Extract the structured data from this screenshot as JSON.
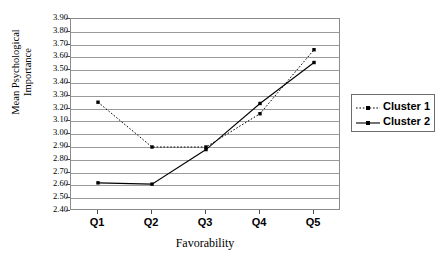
{
  "chart_data": {
    "type": "line",
    "title": "",
    "xlabel": "Favorability",
    "ylabel": "Mean Psychological\nImportance",
    "categories": [
      "Q1",
      "Q2",
      "Q3",
      "Q4",
      "Q5"
    ],
    "ylim": [
      2.4,
      3.9
    ],
    "ystep": 0.1,
    "ytick_labels": [
      "3.90",
      "3.80",
      "3.70",
      "3.60",
      "3.50",
      "3.40",
      "3.30",
      "3.20",
      "3.10",
      "3.00",
      "2.90",
      "2.80",
      "2.70",
      "2.60",
      "2.50",
      "2.40"
    ],
    "grid": true,
    "legend_position": "right",
    "series": [
      {
        "name": "Cluster 1",
        "values": [
          3.25,
          2.9,
          2.9,
          3.16,
          3.66
        ],
        "line_style": "dotted",
        "marker": "square",
        "color": "#000000"
      },
      {
        "name": "Cluster 2",
        "values": [
          2.62,
          2.61,
          2.88,
          3.24,
          3.56
        ],
        "line_style": "solid",
        "marker": "square",
        "color": "#000000"
      }
    ]
  },
  "axes": {
    "y_title": "Mean Psychological\nImportance",
    "x_title": "Favorability"
  },
  "legend": {
    "items": [
      {
        "label": "Cluster 1"
      },
      {
        "label": "Cluster 2"
      }
    ]
  },
  "colors": {
    "grid": "#9a9a9a",
    "border": "#8a8a8a",
    "series": "#000000",
    "text": "#000000"
  }
}
